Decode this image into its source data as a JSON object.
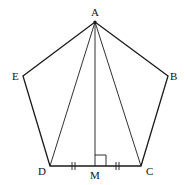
{
  "diagram": {
    "points": {
      "A": {
        "label": "A",
        "x": 95,
        "y": 22
      },
      "B": {
        "label": "B",
        "x": 168,
        "y": 76
      },
      "C": {
        "label": "C",
        "x": 141,
        "y": 166
      },
      "D": {
        "label": "D",
        "x": 50,
        "y": 166
      },
      "E": {
        "label": "E",
        "x": 23,
        "y": 76
      },
      "M": {
        "label": "M",
        "x": 95,
        "y": 166
      }
    },
    "labels": {
      "A": "A",
      "B": "B",
      "C": "C",
      "D": "D",
      "E": "E",
      "M": "M"
    },
    "polygon": [
      "A",
      "B",
      "C",
      "D",
      "E"
    ],
    "segments": [
      [
        "A",
        "D"
      ],
      [
        "A",
        "C"
      ],
      [
        "A",
        "M"
      ]
    ],
    "marks": {
      "right_angle_at": "M",
      "equal_ticks": [
        "DM",
        "MC"
      ],
      "tick_style": "double"
    },
    "colors": {
      "stroke": "#1a1a1a",
      "background": "#ffffff"
    }
  }
}
